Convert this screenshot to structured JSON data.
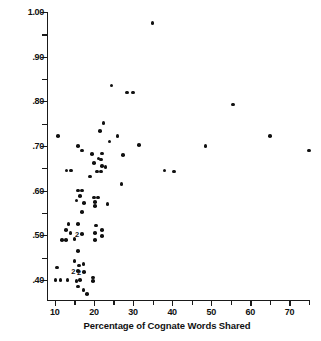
{
  "chart_data": {
    "type": "scatter",
    "title": "",
    "xlabel": "Percentage of Cognate Words Shared",
    "ylabel": "Phi Values for Culture Traits Shared",
    "xlim": [
      8,
      75
    ],
    "ylim": [
      0.355,
      1.0
    ],
    "grid": false,
    "legend": null,
    "xticks": [
      10,
      20,
      30,
      40,
      50,
      60,
      70
    ],
    "xtick_labels": [
      "10",
      "20",
      "30",
      "40",
      "50",
      "60",
      "70"
    ],
    "xminor_ticks": [
      15,
      25,
      35,
      45,
      55,
      65,
      75
    ],
    "yticks": [
      0.4,
      0.5,
      0.6,
      0.7,
      0.8,
      0.9,
      1.0
    ],
    "ytick_labels": [
      ".40",
      ".50",
      ".60",
      ".70",
      ".80",
      ".90",
      "1.00"
    ],
    "yminor_ticks": [
      0.45,
      0.55,
      0.65,
      0.75,
      0.85,
      0.95
    ],
    "marker": "filled-circle",
    "marker_color": "#111111",
    "points": [
      {
        "x": 35.0,
        "y": 0.975
      },
      {
        "x": 24.5,
        "y": 0.835
      },
      {
        "x": 28.5,
        "y": 0.82
      },
      {
        "x": 30.0,
        "y": 0.82
      },
      {
        "x": 22.5,
        "y": 0.752
      },
      {
        "x": 10.8,
        "y": 0.722
      },
      {
        "x": 21.5,
        "y": 0.733
      },
      {
        "x": 26.0,
        "y": 0.722
      },
      {
        "x": 24.0,
        "y": 0.71
      },
      {
        "x": 55.5,
        "y": 0.793
      },
      {
        "x": 16.0,
        "y": 0.7
      },
      {
        "x": 31.5,
        "y": 0.702
      },
      {
        "x": 48.5,
        "y": 0.7
      },
      {
        "x": 65.0,
        "y": 0.722
      },
      {
        "x": 75.0,
        "y": 0.69
      },
      {
        "x": 17.0,
        "y": 0.69
      },
      {
        "x": 19.5,
        "y": 0.682
      },
      {
        "x": 22.0,
        "y": 0.683
      },
      {
        "x": 21.2,
        "y": 0.672
      },
      {
        "x": 21.8,
        "y": 0.67
      },
      {
        "x": 27.5,
        "y": 0.68
      },
      {
        "x": 20.0,
        "y": 0.662
      },
      {
        "x": 22.0,
        "y": 0.655
      },
      {
        "x": 23.0,
        "y": 0.653
      },
      {
        "x": 13.0,
        "y": 0.645
      },
      {
        "x": 14.2,
        "y": 0.645
      },
      {
        "x": 20.8,
        "y": 0.643
      },
      {
        "x": 21.8,
        "y": 0.643
      },
      {
        "x": 38.0,
        "y": 0.645
      },
      {
        "x": 40.5,
        "y": 0.643
      },
      {
        "x": 19.0,
        "y": 0.632
      },
      {
        "x": 27.0,
        "y": 0.615
      },
      {
        "x": 16.0,
        "y": 0.6
      },
      {
        "x": 17.0,
        "y": 0.6
      },
      {
        "x": 16.5,
        "y": 0.588
      },
      {
        "x": 20.0,
        "y": 0.585
      },
      {
        "x": 21.0,
        "y": 0.585
      },
      {
        "x": 15.5,
        "y": 0.578
      },
      {
        "x": 17.5,
        "y": 0.572
      },
      {
        "x": 20.2,
        "y": 0.575
      },
      {
        "x": 20.2,
        "y": 0.565
      },
      {
        "x": 23.5,
        "y": 0.57
      },
      {
        "x": 17.0,
        "y": 0.552
      },
      {
        "x": 13.5,
        "y": 0.525
      },
      {
        "x": 16.0,
        "y": 0.525
      },
      {
        "x": 20.5,
        "y": 0.522
      },
      {
        "x": 12.8,
        "y": 0.512
      },
      {
        "x": 14.0,
        "y": 0.505
      },
      {
        "x": 17.0,
        "y": 0.503,
        "label": "2"
      },
      {
        "x": 20.3,
        "y": 0.505
      },
      {
        "x": 22.0,
        "y": 0.512
      },
      {
        "x": 11.8,
        "y": 0.49
      },
      {
        "x": 12.8,
        "y": 0.49
      },
      {
        "x": 15.0,
        "y": 0.492
      },
      {
        "x": 20.3,
        "y": 0.49
      },
      {
        "x": 22.0,
        "y": 0.498
      },
      {
        "x": 16.0,
        "y": 0.465
      },
      {
        "x": 15.0,
        "y": 0.443
      },
      {
        "x": 10.5,
        "y": 0.428
      },
      {
        "x": 16.2,
        "y": 0.432
      },
      {
        "x": 17.3,
        "y": 0.435
      },
      {
        "x": 16.0,
        "y": 0.42,
        "label": "2"
      },
      {
        "x": 17.5,
        "y": 0.418,
        "label": "2"
      },
      {
        "x": 10.2,
        "y": 0.4
      },
      {
        "x": 11.5,
        "y": 0.4
      },
      {
        "x": 13.2,
        "y": 0.4
      },
      {
        "x": 15.5,
        "y": 0.398
      },
      {
        "x": 16.5,
        "y": 0.4
      },
      {
        "x": 19.8,
        "y": 0.405
      },
      {
        "x": 19.8,
        "y": 0.397
      },
      {
        "x": 16.0,
        "y": 0.385
      },
      {
        "x": 17.3,
        "y": 0.378
      },
      {
        "x": 18.3,
        "y": 0.368
      }
    ]
  }
}
